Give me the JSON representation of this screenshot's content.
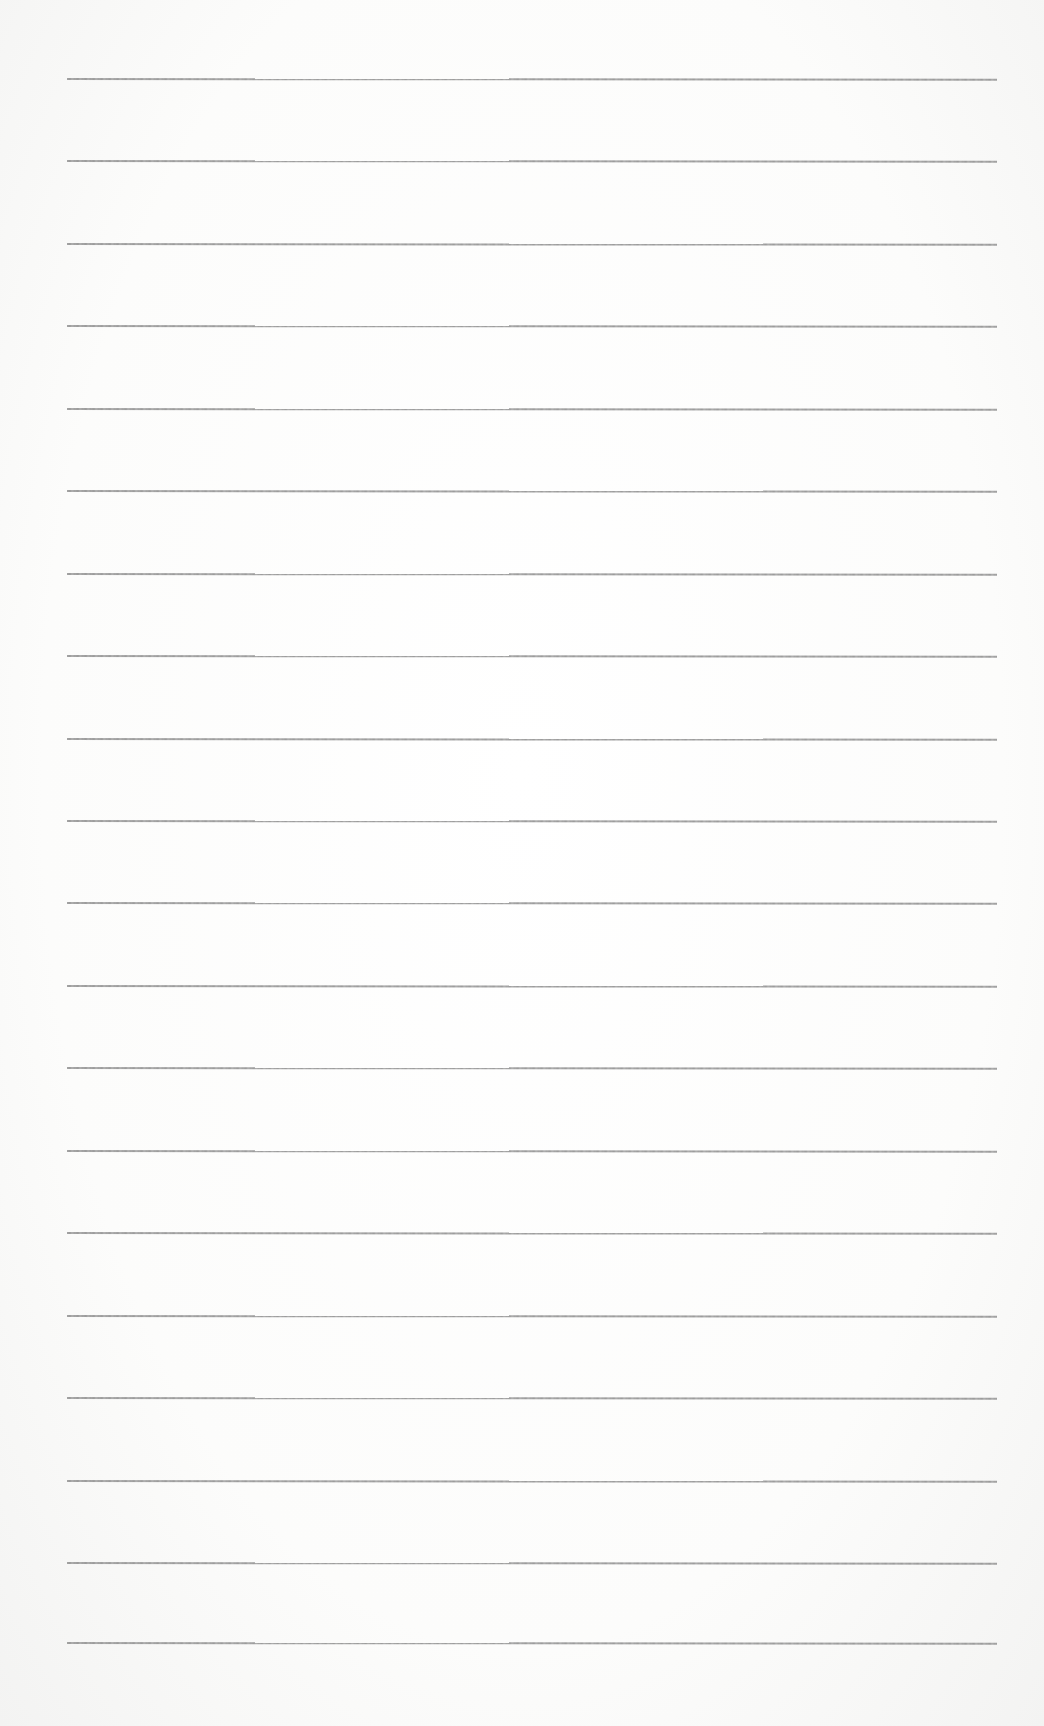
{
  "page": {
    "type": "ruled-paper",
    "background_color": "#fbfbfa",
    "line_color": "#9a9a9a",
    "line_count": 20,
    "line_left": 67,
    "line_width": 930,
    "lines_y": [
      78,
      160,
      243,
      325,
      408,
      490,
      573,
      655,
      738,
      820,
      902,
      985,
      1067,
      1150,
      1232,
      1315,
      1397,
      1480,
      1562,
      1642
    ]
  }
}
